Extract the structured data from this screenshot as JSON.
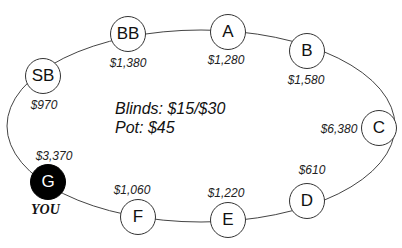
{
  "table": {
    "blinds_label": "Blinds: $15/$30",
    "pot_label": "Pot: $45",
    "you_label": "YOU"
  },
  "seats": [
    {
      "id": "BB",
      "label": "BB",
      "stack": "$1,380",
      "hero": false
    },
    {
      "id": "A",
      "label": "A",
      "stack": "$1,280",
      "hero": false
    },
    {
      "id": "B",
      "label": "B",
      "stack": "$1,580",
      "hero": false
    },
    {
      "id": "C",
      "label": "C",
      "stack": "$6,380",
      "hero": false
    },
    {
      "id": "D",
      "label": "D",
      "stack": "$610",
      "hero": false
    },
    {
      "id": "E",
      "label": "E",
      "stack": "$1,220",
      "hero": false
    },
    {
      "id": "F",
      "label": "F",
      "stack": "$1,060",
      "hero": false
    },
    {
      "id": "G",
      "label": "G",
      "stack": "$3,370",
      "hero": true
    },
    {
      "id": "SB",
      "label": "SB",
      "stack": "$970",
      "hero": false
    }
  ],
  "colors": {
    "hero_fill": "#000000",
    "seat_fill": "#ffffff",
    "line": "#333333"
  }
}
